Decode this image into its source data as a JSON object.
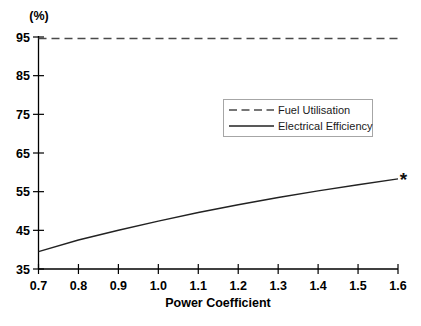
{
  "figure": {
    "width": 421,
    "height": 326,
    "background": "#ffffff",
    "axis_color": "#000000",
    "text_color": "#000000",
    "legend_border_color": "#a6a6a6"
  },
  "chart_data": {
    "type": "line",
    "title": "",
    "xlabel": "Power Coefficient",
    "ylabel": "(%)",
    "xlim": [
      0.7,
      1.6
    ],
    "ylim": [
      35,
      95
    ],
    "xticks": [
      "0.7",
      "0.8",
      "0.9",
      "1.0",
      "1.1",
      "1.2",
      "1.3",
      "1.4",
      "1.5",
      "1.6"
    ],
    "yticks": [
      "35",
      "45",
      "55",
      "65",
      "75",
      "85",
      "95"
    ],
    "grid": false,
    "legend_position": "inside-upper-right",
    "x": [
      0.7,
      0.8,
      0.9,
      1.0,
      1.1,
      1.2,
      1.3,
      1.4,
      1.5,
      1.6
    ],
    "series": [
      {
        "name": "Fuel Utilisation",
        "style": "dashed",
        "color": "#4a4a4a",
        "values": [
          94.6,
          94.6,
          94.6,
          94.6,
          94.6,
          94.6,
          94.6,
          94.6,
          94.6,
          94.6
        ]
      },
      {
        "name": "Electrical Efficiency",
        "style": "solid",
        "color": "#222222",
        "values": [
          39.5,
          42.5,
          45.0,
          47.4,
          49.6,
          51.6,
          53.5,
          55.2,
          56.8,
          58.3
        ]
      }
    ],
    "annotation": {
      "text": "*",
      "x": 1.6,
      "y": 58.3
    }
  }
}
